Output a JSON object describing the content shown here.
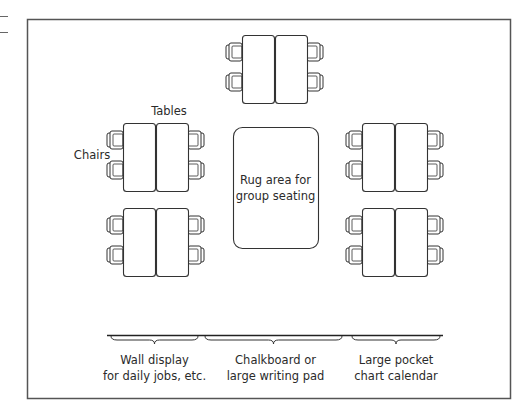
{
  "diagram": {
    "room": {
      "x": 27,
      "y": 19,
      "w": 483,
      "h": 379,
      "stroke": "#555555"
    },
    "colors": {
      "stroke": "#333333",
      "fill": "#ffffff",
      "text": "#2b2b2b"
    },
    "labels": {
      "tables": "Tables",
      "chairs": "Chairs",
      "rug_line1": "Rug area for",
      "rug_line2": "group seating"
    },
    "table_groups": [
      {
        "id": "top-center",
        "x": 242,
        "y": 35
      },
      {
        "id": "upper-left",
        "x": 123,
        "y": 123
      },
      {
        "id": "upper-right",
        "x": 362,
        "y": 123
      },
      {
        "id": "lower-left",
        "x": 123,
        "y": 208
      },
      {
        "id": "lower-right",
        "x": 362,
        "y": 208
      }
    ],
    "rug": {
      "x": 233,
      "y": 127,
      "w": 85,
      "h": 121
    },
    "front_wall": {
      "line": {
        "x1": 107,
        "x2": 443,
        "y": 335
      },
      "sections": [
        {
          "id": "wall-display",
          "x1": 111,
          "x2": 198,
          "line1": "Wall display",
          "line2": "for daily jobs, etc."
        },
        {
          "id": "chalkboard",
          "x1": 205,
          "x2": 342,
          "line1": "Chalkboard or",
          "line2": "large writing pad"
        },
        {
          "id": "pocket-calendar",
          "x1": 352,
          "x2": 440,
          "line1": "Large pocket",
          "line2": "chart calendar"
        }
      ]
    }
  }
}
